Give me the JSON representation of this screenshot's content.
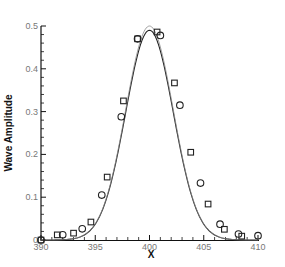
{
  "chart_data": {
    "type": "line",
    "title": "",
    "xlabel": "X",
    "ylabel": "Wave Amplitude",
    "xlim": [
      390,
      410
    ],
    "ylim": [
      0,
      0.5
    ],
    "x_ticks": [
      "390",
      "395",
      "400",
      "405",
      "410"
    ],
    "y_ticks": [
      "0",
      "0.1",
      "0.2",
      "0.3",
      "0.4",
      "0.5"
    ],
    "grid": false,
    "legend": null,
    "series": [
      {
        "name": "curve 1 (solid, dark)",
        "style": "line",
        "color": "#222222",
        "peak": {
          "x": 400,
          "y": 0.49
        },
        "gaussian_sigma": 2.2
      },
      {
        "name": "curve 2 (solid, light)",
        "style": "line",
        "color": "#888888",
        "peak": {
          "x": 400,
          "y": 0.5
        },
        "gaussian_sigma": 2.2
      },
      {
        "name": "circles",
        "style": "marker-circle",
        "color": "#222222",
        "x": [
          390.0,
          392.0,
          393.8,
          395.6,
          397.4,
          398.9,
          401.0,
          402.8,
          404.7,
          406.5,
          408.2,
          410.0
        ],
        "y": [
          0.0,
          0.012,
          0.026,
          0.105,
          0.288,
          0.47,
          0.478,
          0.315,
          0.133,
          0.037,
          0.014,
          0.01
        ]
      },
      {
        "name": "squares",
        "style": "marker-square",
        "color": "#222222",
        "x": [
          390.0,
          391.5,
          393.0,
          394.6,
          396.1,
          397.6,
          398.9,
          400.7,
          402.3,
          403.8,
          405.4,
          406.9,
          408.5
        ],
        "y": [
          0.0,
          0.012,
          0.016,
          0.042,
          0.147,
          0.325,
          0.47,
          0.486,
          0.367,
          0.205,
          0.084,
          0.025,
          0.009
        ]
      }
    ]
  }
}
